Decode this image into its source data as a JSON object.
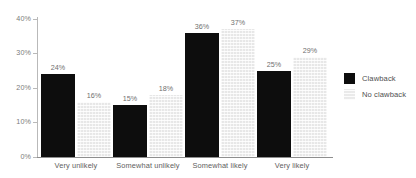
{
  "chart_data": {
    "type": "bar",
    "title": "",
    "subtitle": "",
    "xlabel": "",
    "ylabel": "",
    "categories": [
      "Very unlikely",
      "Somewhat unlikely",
      "Somewhat likely",
      "Very likely"
    ],
    "series": [
      {
        "name": "Clawback",
        "color": "#0d0d0d",
        "values": [
          24,
          15,
          36,
          25
        ],
        "labels": [
          "24%",
          "15%",
          "36%",
          "25%"
        ]
      },
      {
        "name": "No clawback",
        "color": "#ededed",
        "values": [
          16,
          18,
          37,
          29
        ],
        "labels": [
          "16%",
          "18%",
          "37%",
          "29%"
        ]
      }
    ],
    "ylim": [
      0,
      40
    ],
    "y_ticks": [
      0,
      10,
      20,
      30,
      40
    ],
    "y_tick_labels": [
      "0%",
      "10%",
      "20%",
      "30%",
      "40%"
    ],
    "grid": false,
    "legend_position": "right"
  },
  "legend": {
    "items": [
      {
        "label": "Clawback",
        "swatch": "dark-swatch"
      },
      {
        "label": "No clawback",
        "swatch": "light-swatch"
      }
    ]
  },
  "axis": {
    "y_labels": [
      "40%",
      "30%",
      "20%",
      "10%",
      "0%"
    ]
  }
}
